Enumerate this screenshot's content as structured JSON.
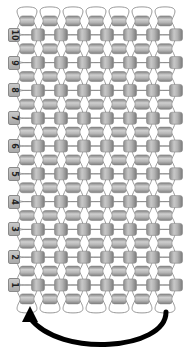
{
  "diagram": {
    "type": "beadwork-stitch-pattern",
    "row_labels": [
      "1",
      "2",
      "3",
      "4",
      "5",
      "6",
      "7",
      "8",
      "9",
      "10"
    ],
    "row_count": 10,
    "beads_per_labeled_row": 7,
    "beads_per_offset_row": 7,
    "bead_color": "#a8a8a8",
    "bead_highlight": "#e0e0e0",
    "bead_shadow": "#7d7d7d",
    "thread_color": "#8c8c8c",
    "arrow": {
      "direction": "right-to-left",
      "description": "curved return arrow below row 1",
      "color": "#000000"
    }
  }
}
